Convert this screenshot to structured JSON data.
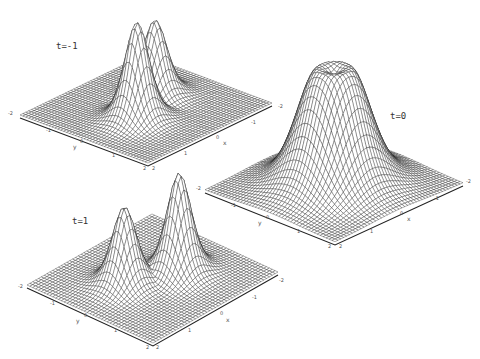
{
  "chart_data": [
    {
      "type": "surface",
      "title": "t=-1",
      "xlabel": "x",
      "ylabel": "y",
      "x_ticks": [
        "-2",
        "-1",
        "0",
        "1",
        "2"
      ],
      "y_ticks": [
        "-2",
        "-1",
        "0",
        "1",
        "2"
      ],
      "xlim": [
        -2,
        2
      ],
      "ylim": [
        -2,
        2
      ],
      "grid": "wireframe mesh",
      "features": [
        {
          "description": "smaller peak",
          "x": -0.6,
          "y": -0.3,
          "height": 0.75
        },
        {
          "description": "taller peak",
          "x": 0.6,
          "y": 0.3,
          "height": 1.0
        }
      ],
      "corners_px": {
        "left": [
          20,
          115
        ],
        "back": [
          148,
          50
        ],
        "right": [
          272,
          103
        ],
        "front": [
          148,
          163
        ]
      },
      "label_px": [
        56,
        47
      ]
    },
    {
      "type": "surface",
      "title": "t=0",
      "xlabel": "x",
      "ylabel": "y",
      "x_ticks": [
        "-2",
        "-1",
        "0",
        "1",
        "2"
      ],
      "y_ticks": [
        "-2",
        "-1",
        "0",
        "1",
        "2"
      ],
      "xlim": [
        -2,
        2
      ],
      "ylim": [
        -2,
        2
      ],
      "grid": "wireframe mesh",
      "features": [
        {
          "description": "single merged plateau with slight crater on top",
          "x": 0,
          "y": 0,
          "height": 1.0
        }
      ],
      "corners_px": {
        "left": [
          205,
          190
        ],
        "back": [
          335,
          136
        ],
        "right": [
          463,
          183
        ],
        "front": [
          335,
          242
        ]
      },
      "label_px": [
        390,
        117
      ]
    },
    {
      "type": "surface",
      "title": "t=1",
      "xlabel": "x",
      "ylabel": "y",
      "x_ticks": [
        "-2",
        "-1",
        "0",
        "1",
        "2"
      ],
      "y_ticks": [
        "-2",
        "-1",
        "0",
        "1",
        "2"
      ],
      "xlim": [
        -2,
        2
      ],
      "ylim": [
        -2,
        2
      ],
      "grid": "wireframe mesh",
      "features": [
        {
          "description": "taller peak",
          "x": -0.6,
          "y": 0.3,
          "height": 1.0
        },
        {
          "description": "smaller peak",
          "x": 0.6,
          "y": -0.3,
          "height": 0.75
        }
      ],
      "corners_px": {
        "left": [
          27,
          285
        ],
        "back": [
          152,
          228
        ],
        "right": [
          278,
          272
        ],
        "front": [
          153,
          343
        ]
      },
      "label_px": [
        72,
        222
      ]
    }
  ],
  "panels": [
    {
      "label": "t=-1",
      "peak_px": [
        [
          118,
          38
        ],
        [
          173,
          13
        ]
      ],
      "ticks": {
        "y": [
          {
            "t": "-2",
            "p": [
              8,
              113
            ]
          },
          {
            "t": "-1",
            "p": [
              46,
              130
            ]
          },
          {
            "t": "y",
            "p": [
              73,
              146
            ]
          },
          {
            "t": "0",
            "p": [
              80,
              141
            ]
          },
          {
            "t": "1",
            "p": [
              112,
              155
            ]
          },
          {
            "t": "2",
            "p": [
              143,
              168
            ]
          }
        ],
        "x": [
          {
            "t": "2",
            "p": [
              152,
              168
            ]
          },
          {
            "t": "1",
            "p": [
              184,
              153
            ]
          },
          {
            "t": "0",
            "p": [
              216,
              137
            ]
          },
          {
            "t": "x",
            "p": [
              223,
              142
            ]
          },
          {
            "t": "-1",
            "p": [
              251,
              122
            ]
          },
          {
            "t": "-2",
            "p": [
              278,
              106
            ]
          }
        ]
      }
    },
    {
      "label": "t=0",
      "ticks": {
        "y": [
          {
            "t": "-2",
            "p": [
              196,
              188
            ]
          },
          {
            "t": "-1",
            "p": [
              231,
              205
            ]
          },
          {
            "t": "y",
            "p": [
              258,
              222
            ]
          },
          {
            "t": "0",
            "p": [
              266,
              217
            ]
          },
          {
            "t": "1",
            "p": [
              297,
              231
            ]
          },
          {
            "t": "2",
            "p": [
              328,
              246
            ]
          }
        ],
        "x": [
          {
            "t": "2",
            "p": [
              339,
              246
            ]
          },
          {
            "t": "1",
            "p": [
              370,
              231
            ]
          },
          {
            "t": "0",
            "p": [
              400,
              213
            ]
          },
          {
            "t": "x",
            "p": [
              407,
              218
            ]
          },
          {
            "t": "-1",
            "p": [
              434,
              198
            ]
          },
          {
            "t": "-2",
            "p": [
              466,
              181
            ]
          }
        ]
      }
    },
    {
      "label": "t=1",
      "peak_px": [
        [
          122,
          191
        ],
        [
          178,
          218
        ]
      ],
      "ticks": {
        "y": [
          {
            "t": "-2",
            "p": [
              18,
              286
            ]
          },
          {
            "t": "-1",
            "p": [
              50,
              303
            ]
          },
          {
            "t": "y",
            "p": [
              76,
              320
            ]
          },
          {
            "t": "0",
            "p": [
              84,
              315
            ]
          },
          {
            "t": "1",
            "p": [
              114,
              330
            ]
          },
          {
            "t": "2",
            "p": [
              146,
              347
            ]
          }
        ],
        "x": [
          {
            "t": "2",
            "p": [
              156,
              347
            ]
          },
          {
            "t": "1",
            "p": [
              188,
              330
            ]
          },
          {
            "t": "0",
            "p": [
              220,
              313
            ]
          },
          {
            "t": "x",
            "p": [
              226,
              319
            ]
          },
          {
            "t": "-1",
            "p": [
              252,
              297
            ]
          },
          {
            "t": "-2",
            "p": [
              279,
              280
            ]
          }
        ]
      }
    }
  ],
  "style": {
    "background": "#ffffff",
    "mesh_color": "#1a1a1a",
    "surface_fill": "#ffffff",
    "base_edge_color": "#222222"
  }
}
